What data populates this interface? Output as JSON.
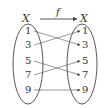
{
  "diagram": {
    "type": "function-mapping",
    "function_name": "f",
    "domain": {
      "name": "X",
      "elements": [
        "1",
        "3",
        "5",
        "7",
        "9"
      ]
    },
    "codomain": {
      "name": "X",
      "elements": [
        "1",
        "3",
        "5",
        "7",
        "9"
      ]
    },
    "mappings": [
      {
        "from": "1",
        "to": "3"
      },
      {
        "from": "3",
        "to": "1"
      },
      {
        "from": "5",
        "to": "7"
      },
      {
        "from": "7",
        "to": "5"
      },
      {
        "from": "9",
        "to": "9"
      }
    ],
    "colors": {
      "stroke": "#444444",
      "text": "#333333"
    }
  }
}
